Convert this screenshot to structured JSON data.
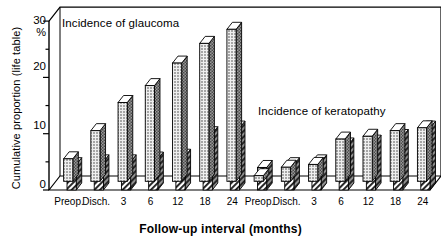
{
  "chart_data": {
    "type": "bar",
    "title": "",
    "xlabel": "Follow-up interval (months)",
    "ylabel": "Cumulative proportion (life table)",
    "yunit": "%",
    "ylim": [
      0,
      30
    ],
    "yticks": [
      0,
      10,
      20,
      30
    ],
    "yminor": [
      5,
      15,
      25
    ],
    "grid": false,
    "legend": null,
    "style": "3d-grouped-bar",
    "annotations": [
      {
        "text": "Incidence of glaucoma",
        "group": "glaucoma"
      },
      {
        "text": "Incidence of keratopathy",
        "group": "keratopathy"
      }
    ],
    "categories": [
      "Preop.",
      "Disch.",
      "3",
      "6",
      "12",
      "18",
      "24"
    ],
    "panels": [
      {
        "name": "glaucoma",
        "label": "Incidence of glaucoma",
        "categories": [
          "Preop.",
          "Disch.",
          "3",
          "6",
          "12",
          "18",
          "24"
        ],
        "series": [
          {
            "name": "series-dotted",
            "pattern": "dotted",
            "values": [
              4.0,
              9.0,
              14.0,
              17.0,
              21.0,
              24.5,
              27.0
            ]
          },
          {
            "name": "series-hatched",
            "pattern": "hatched",
            "values": [
              4.5,
              5.0,
              5.0,
              5.5,
              6.0,
              10.0,
              11.0
            ]
          }
        ]
      },
      {
        "name": "keratopathy",
        "label": "Incidence of keratopathy",
        "categories": [
          "Preop.",
          "Disch.",
          "3",
          "6",
          "12",
          "18",
          "24"
        ],
        "series": [
          {
            "name": "series-dotted",
            "pattern": "dotted",
            "values": [
              1.0,
              2.5,
              3.0,
              7.5,
              8.0,
              9.0,
              9.5
            ]
          },
          {
            "name": "series-hatched",
            "pattern": "hatched",
            "values": [
              4.0,
              4.5,
              5.0,
              8.0,
              8.5,
              9.5,
              11.0
            ]
          }
        ]
      }
    ]
  },
  "axes": {
    "ytitle": "Cumulative proportion (life table)",
    "ypercent": "%",
    "yticklabels": [
      "30",
      "20",
      "10",
      "0"
    ],
    "xtitle": "Follow-up interval (months)",
    "xticklabels_left": [
      "Preop.",
      "Disch.",
      "3",
      "6",
      "12",
      "18",
      "24"
    ],
    "xticklabels_right": [
      "Preop.",
      "Disch.",
      "3",
      "6",
      "12",
      "18",
      "24"
    ]
  },
  "annotations": {
    "glaucoma": "Incidence of glaucoma",
    "keratopathy": "Incidence of keratopathy"
  },
  "colors": {
    "axis": "#000000",
    "bar_front_dotted": "#e8e8e8",
    "bar_front_hatched": "#ffffff",
    "bar_side": "#8a8a8a",
    "bar_top": "#ffffff",
    "background": "#ffffff"
  }
}
